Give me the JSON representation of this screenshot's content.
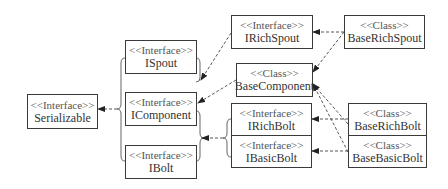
{
  "diagram": {
    "type": "uml-class-hierarchy",
    "nodes": {
      "serializable": {
        "stereotype": "<<Interface>>",
        "name": "Serializable"
      },
      "ispout": {
        "stereotype": "<<Interface>>",
        "name": "ISpout"
      },
      "icomponent": {
        "stereotype": "<<Interface>>",
        "name": "IComponent"
      },
      "ibolt": {
        "stereotype": "<<Interface>>",
        "name": "IBolt"
      },
      "irichspout": {
        "stereotype": "<<Interface>>",
        "name": "IRichSpout"
      },
      "baserichspout": {
        "stereotype": "<<Class>>",
        "name": "BaseRichSpout"
      },
      "basecomponent": {
        "stereotype": "<<Class>>",
        "name": "BaseComponent"
      },
      "irichbolt": {
        "stereotype": "<<Interface>>",
        "name": "IRichBolt"
      },
      "ibasicbolt": {
        "stereotype": "<<Interface>>",
        "name": "IBasicBolt"
      },
      "baserichbolt": {
        "stereotype": "<<Class>>",
        "name": "BaseRichBolt"
      },
      "basebasicbolt": {
        "stereotype": "<<Class>>",
        "name": "BaseBasicBolt"
      }
    },
    "edges": [
      {
        "from": "ISpout/IComponent/IBolt",
        "to": "Serializable",
        "style": "dashed"
      },
      {
        "from": "IRichSpout",
        "to": "ISpout",
        "style": "dashed"
      },
      {
        "from": "BaseComponent",
        "to": "IComponent",
        "style": "dashed"
      },
      {
        "from": "IRichBolt/IBasicBolt",
        "to": "IComponent",
        "style": "dashed"
      },
      {
        "from": "BaseRichSpout",
        "to": "IRichSpout",
        "style": "dashed"
      },
      {
        "from": "BaseRichSpout",
        "to": "BaseComponent",
        "style": "dashed"
      },
      {
        "from": "BaseRichBolt",
        "to": "BaseComponent",
        "style": "dashed"
      },
      {
        "from": "BaseBasicBolt",
        "to": "BaseComponent",
        "style": "dashed"
      },
      {
        "from": "BaseRichBolt",
        "to": "IRichBolt",
        "style": "dashed"
      },
      {
        "from": "BaseBasicBolt",
        "to": "IBasicBolt",
        "style": "dashed"
      }
    ],
    "colors": {
      "line": "#3a3a3a",
      "text": "#333333",
      "background": "#ffffff"
    }
  }
}
